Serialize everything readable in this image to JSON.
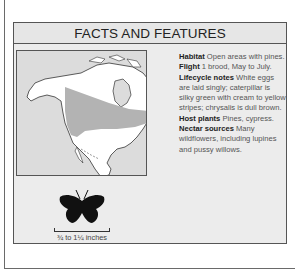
{
  "panel": {
    "title": "FACTS AND FEATURES"
  },
  "map": {
    "description": "North America range map",
    "range_color": "#b3b3b3",
    "land_color": "#ffffff",
    "water_color": "#dcdcdc"
  },
  "facts": [
    {
      "label": "Habitat",
      "text": " Open areas with pines."
    },
    {
      "label": "Flight",
      "text": " 1 brood, May to July."
    },
    {
      "label": "Lifecycle notes",
      "text": " White eggs are laid singly; caterpillar is silky green with cream to yellow stripes; chrysalis is dull brown."
    },
    {
      "label": "Host plants",
      "text": " Pines, cypress."
    },
    {
      "label": "Nectar sources",
      "text": " Many wildflowers, including lupines and pussy willows."
    }
  ],
  "size": {
    "label": "¾ to 1¼ inches"
  }
}
